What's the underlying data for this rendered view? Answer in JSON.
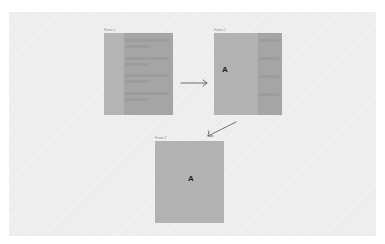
{
  "diagram": {
    "frames": [
      {
        "id": "frame-1",
        "label": "Frame 1",
        "letter": "",
        "list_items": 4
      },
      {
        "id": "frame-2",
        "label": "Frame 2",
        "letter": "A",
        "list_items": 4
      },
      {
        "id": "frame-3",
        "label": "Frame 3",
        "letter": "A",
        "list_items": 0
      }
    ],
    "arrows": [
      {
        "from": "frame-1",
        "to": "frame-2",
        "direction": "right"
      },
      {
        "from": "frame-2",
        "to": "frame-3",
        "direction": "down-left"
      }
    ],
    "colors": {
      "canvas": "#ececec",
      "frame": "#b2b2b2",
      "panel": "#a5a5a5",
      "bar": "#9c9c9c",
      "arrow": "#6e6e6e",
      "letter": "#1e1e1e"
    }
  }
}
